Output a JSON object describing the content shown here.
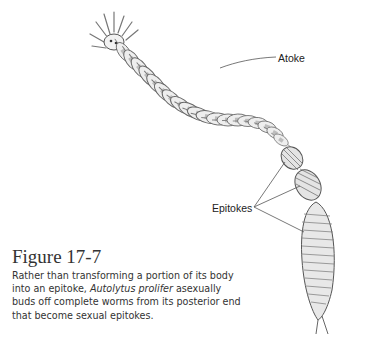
{
  "figure": {
    "title": "Figure 17-7",
    "caption": {
      "part1": "Rather than transforming a portion of its body into an epitoke, ",
      "species_italic": "Autolytus prolifer",
      "part2": " asexually buds off complete worms from its posterior end that become sexual epitokes."
    },
    "labels": {
      "atoke": "Atoke",
      "epitokes": "Epitokes"
    },
    "illustration": "worm-autolytus-prolifer",
    "colors": {
      "outline": "#555555",
      "segment_fill": "#eeeeee",
      "segment_band": "#bdbdbd",
      "leader_line": "#555555"
    }
  }
}
